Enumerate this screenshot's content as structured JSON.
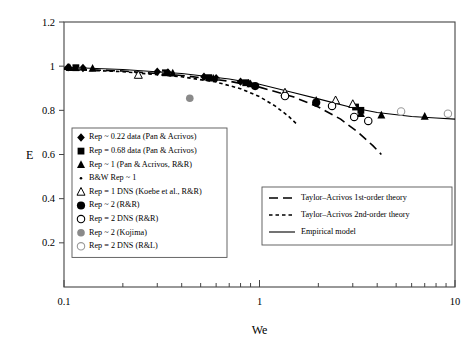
{
  "chart_data": {
    "type": "scatter",
    "title": "",
    "xlabel": "We",
    "ylabel": "E",
    "xscale": "log",
    "xlim": [
      0.1,
      10
    ],
    "ylim": [
      0,
      1.2
    ],
    "xticklabels": [
      "0.1",
      "1",
      "10"
    ],
    "xtickvalues": [
      0.1,
      1,
      10
    ],
    "yticklabels": [
      "0",
      "0.2",
      "0.4",
      "0.6",
      "0.8",
      "1",
      "1.2"
    ],
    "ytickvalues": [
      0,
      0.2,
      0.4,
      0.6,
      0.8,
      1.0,
      1.2
    ],
    "grid": false,
    "legend_position": "inner-lower-left and inner-lower-right",
    "series": [
      {
        "name": "Rep ~ 0.22 data (Pan & Acrivos)",
        "marker": "filled-diamond",
        "color": "#000000",
        "points": [
          {
            "x": 0.105,
            "y": 0.995
          },
          {
            "x": 0.125,
            "y": 0.992
          },
          {
            "x": 0.3,
            "y": 0.975
          },
          {
            "x": 0.34,
            "y": 0.972
          },
          {
            "x": 0.52,
            "y": 0.952
          },
          {
            "x": 0.6,
            "y": 0.945
          },
          {
            "x": 0.8,
            "y": 0.93
          },
          {
            "x": 0.88,
            "y": 0.922
          }
        ]
      },
      {
        "name": "Rep = 0.68 data (Pan & Acrivos)",
        "marker": "filled-square",
        "color": "#000000",
        "points": [
          {
            "x": 0.115,
            "y": 0.993
          },
          {
            "x": 0.33,
            "y": 0.97
          },
          {
            "x": 0.55,
            "y": 0.948
          },
          {
            "x": 0.85,
            "y": 0.925
          },
          {
            "x": 3.1,
            "y": 0.815
          },
          {
            "x": 3.3,
            "y": 0.8
          }
        ]
      },
      {
        "name": "Rep ~ 1 (Pan & Acrivos, R&R)",
        "marker": "filled-triangle",
        "color": "#000000",
        "points": [
          {
            "x": 0.107,
            "y": 0.993
          },
          {
            "x": 0.14,
            "y": 0.99
          },
          {
            "x": 0.36,
            "y": 0.968
          },
          {
            "x": 0.58,
            "y": 0.945
          },
          {
            "x": 0.9,
            "y": 0.92
          },
          {
            "x": 1.95,
            "y": 0.845
          },
          {
            "x": 3.3,
            "y": 0.785
          },
          {
            "x": 4.2,
            "y": 0.778
          },
          {
            "x": 7.0,
            "y": 0.772
          }
        ]
      },
      {
        "name": "B&W Rep ~ 1",
        "marker": "small-dot",
        "color": "#444444",
        "points": [
          {
            "x": 0.12,
            "y": 0.99
          },
          {
            "x": 0.32,
            "y": 0.972
          },
          {
            "x": 0.62,
            "y": 0.942
          }
        ]
      },
      {
        "name": "Rep = 1 DNS (Koebe et al., R&R)",
        "marker": "open-triangle",
        "color": "#000000",
        "points": [
          {
            "x": 0.24,
            "y": 0.96
          },
          {
            "x": 1.35,
            "y": 0.88
          },
          {
            "x": 2.45,
            "y": 0.845
          },
          {
            "x": 3.0,
            "y": 0.828
          }
        ]
      },
      {
        "name": "Rep ~ 2 (R&R)",
        "marker": "filled-circle",
        "color": "#000000",
        "points": [
          {
            "x": 0.95,
            "y": 0.91
          },
          {
            "x": 1.95,
            "y": 0.835
          }
        ]
      },
      {
        "name": "Rep = 2 DNS (R&R)",
        "marker": "open-circle",
        "color": "#000000",
        "points": [
          {
            "x": 1.35,
            "y": 0.865
          },
          {
            "x": 2.35,
            "y": 0.82
          },
          {
            "x": 3.05,
            "y": 0.77
          },
          {
            "x": 3.6,
            "y": 0.752
          }
        ]
      },
      {
        "name": "Rep ~ 2 (Kojima)",
        "marker": "gray-filled-circle",
        "color": "#808080",
        "points": [
          {
            "x": 0.44,
            "y": 0.855
          }
        ]
      },
      {
        "name": "Rep = 2 DNS (R&L)",
        "marker": "gray-open-circle",
        "color": "#999999",
        "points": [
          {
            "x": 5.3,
            "y": 0.795
          },
          {
            "x": 9.2,
            "y": 0.785
          }
        ]
      }
    ],
    "curves": [
      {
        "name": "Taylor-Acrivos 1st-order theory",
        "style": "long-dash",
        "color": "#000000",
        "points": [
          {
            "x": 0.1,
            "y": 0.988
          },
          {
            "x": 0.2,
            "y": 0.978
          },
          {
            "x": 0.4,
            "y": 0.958
          },
          {
            "x": 0.7,
            "y": 0.932
          },
          {
            "x": 1.0,
            "y": 0.905
          },
          {
            "x": 1.5,
            "y": 0.86
          },
          {
            "x": 2.0,
            "y": 0.815
          },
          {
            "x": 2.6,
            "y": 0.76
          },
          {
            "x": 3.2,
            "y": 0.7
          },
          {
            "x": 3.8,
            "y": 0.64
          },
          {
            "x": 4.2,
            "y": 0.6
          }
        ]
      },
      {
        "name": "Taylor-Acrivos 2nd-order theory",
        "style": "short-dash",
        "color": "#000000",
        "points": [
          {
            "x": 0.1,
            "y": 0.986
          },
          {
            "x": 0.2,
            "y": 0.975
          },
          {
            "x": 0.4,
            "y": 0.952
          },
          {
            "x": 0.6,
            "y": 0.928
          },
          {
            "x": 0.8,
            "y": 0.898
          },
          {
            "x": 1.0,
            "y": 0.862
          },
          {
            "x": 1.2,
            "y": 0.82
          },
          {
            "x": 1.4,
            "y": 0.775
          },
          {
            "x": 1.55,
            "y": 0.738
          }
        ]
      },
      {
        "name": "Empirical model",
        "style": "solid",
        "color": "#000000",
        "points": [
          {
            "x": 0.1,
            "y": 0.995
          },
          {
            "x": 0.2,
            "y": 0.985
          },
          {
            "x": 0.4,
            "y": 0.967
          },
          {
            "x": 0.7,
            "y": 0.942
          },
          {
            "x": 1.0,
            "y": 0.918
          },
          {
            "x": 1.5,
            "y": 0.88
          },
          {
            "x": 2.0,
            "y": 0.852
          },
          {
            "x": 3.0,
            "y": 0.812
          },
          {
            "x": 4.0,
            "y": 0.79
          },
          {
            "x": 6.0,
            "y": 0.772
          },
          {
            "x": 8.0,
            "y": 0.765
          },
          {
            "x": 10.0,
            "y": 0.76
          }
        ]
      }
    ]
  },
  "legend_left": {
    "items": [
      {
        "marker": "filled-diamond",
        "label": "Rep ~ 0.22 data (Pan & Acrivos)"
      },
      {
        "marker": "filled-square",
        "label": "Rep = 0.68 data (Pan & Acrivos)"
      },
      {
        "marker": "filled-triangle",
        "label": "Rep ~ 1 (Pan & Acrivos, R&R)"
      },
      {
        "marker": "small-dot",
        "label": "B&W Rep ~ 1"
      },
      {
        "marker": "open-triangle",
        "label": "Rep = 1 DNS (Koebe et al., R&R)"
      },
      {
        "marker": "filled-circle",
        "label": "Rep ~ 2 (R&R)"
      },
      {
        "marker": "open-circle",
        "label": "Rep = 2 DNS (R&R)"
      },
      {
        "marker": "gray-filled-circle",
        "label": "Rep ~ 2 (Kojima)"
      },
      {
        "marker": "gray-open-circle",
        "label": "Rep = 2 DNS (R&L)"
      }
    ]
  },
  "legend_right": {
    "items": [
      {
        "style": "long-dash",
        "label": "Taylor–Acrivos 1st-order theory"
      },
      {
        "style": "short-dash",
        "label": "Taylor–Acrivos 2nd-order theory"
      },
      {
        "style": "solid",
        "label": "Empirical model"
      }
    ]
  }
}
